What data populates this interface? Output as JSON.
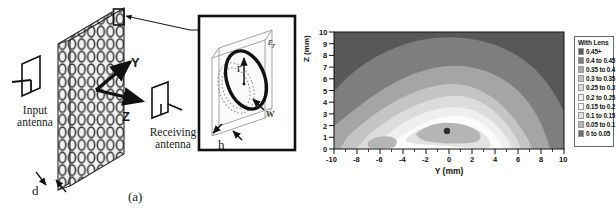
{
  "figure": {
    "panel_a": {
      "caption": "(a)",
      "labels": {
        "input_antenna": "Input\nantenna",
        "input_antenna_line1": "Input",
        "input_antenna_line2": "antenna",
        "receiving_antenna_line1": "Receiving",
        "receiving_antenna_line2": "antenna",
        "axis_y": "Y",
        "axis_z": "Z",
        "thickness_d": "d"
      },
      "inset": {
        "permittivity": "ε",
        "permittivity_sub": "r",
        "radius": "r",
        "width": "w",
        "height": "h"
      },
      "array": {
        "columns": 11,
        "rows": 13,
        "layers": 2
      }
    },
    "panel_b": {
      "caption": "(b)",
      "chart_data": {
        "type": "heatmap",
        "title": "",
        "xlabel": "Y (mm)",
        "ylabel": "Z (mm)",
        "xlim": [
          -10,
          10
        ],
        "ylim": [
          0,
          10
        ],
        "xticks": [
          "-10",
          "-8",
          "-6",
          "-4",
          "-2",
          "0",
          "2",
          "4",
          "6",
          "8",
          "10"
        ],
        "yticks": [
          "0",
          "1",
          "2",
          "3",
          "4",
          "5",
          "6",
          "7",
          "8",
          "9",
          "10"
        ],
        "grid": false,
        "legend_position": "right",
        "legend_title": "With Lens",
        "minimum_marker": {
          "x": 0.0,
          "y": 2.2
        },
        "levels": [
          {
            "label": "0.45+",
            "color": "#585858",
            "min": 0.45,
            "max": null
          },
          {
            "label": "0.4 to 0.45",
            "color": "#7e7e7e",
            "min": 0.4,
            "max": 0.45
          },
          {
            "label": "0.35 to 0.4",
            "color": "#a5a5a5",
            "min": 0.35,
            "max": 0.4
          },
          {
            "label": "0.3 to 0.35",
            "color": "#c4c4c4",
            "min": 0.3,
            "max": 0.35
          },
          {
            "label": "0.25 to 0.3",
            "color": "#dcdcdc",
            "min": 0.25,
            "max": 0.3
          },
          {
            "label": "0.2 to 0.25",
            "color": "#efefef",
            "min": 0.2,
            "max": 0.25
          },
          {
            "label": "0.15 to 0.2",
            "color": "#fbfbfb",
            "min": 0.15,
            "max": 0.2
          },
          {
            "label": "0.1 to 0.15",
            "color": "#e2e2e2",
            "min": 0.1,
            "max": 0.15
          },
          {
            "label": "0.05 to 0.1",
            "color": "#b5b5b5",
            "min": 0.05,
            "max": 0.1
          },
          {
            "label": "0 to 0.05",
            "color": "#6e6e6e",
            "min": 0.0,
            "max": 0.05
          }
        ]
      }
    }
  }
}
